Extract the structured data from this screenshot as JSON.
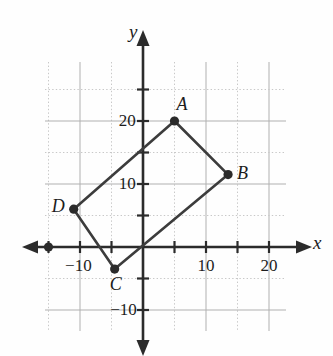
{
  "figure": {
    "kind": "coordinate-plane-quadrilateral",
    "background": "#fefefe",
    "ink": "#3c3c3c",
    "grid_major_color": "#b0b0b0",
    "grid_minor_color": "#c8c8c8",
    "axis_color": "#2b2b2b",
    "point_color": "#2b2b2b"
  },
  "axes": {
    "x_label": "x",
    "y_label": "y",
    "x_range": [
      -17,
      23
    ],
    "y_range": [
      -14,
      27
    ],
    "tick_step": 5,
    "grid_step_major": 10,
    "grid_step_minor": 5,
    "x_ticks": [
      {
        "value": -10,
        "label": "−10"
      },
      {
        "value": 10,
        "label": "10"
      },
      {
        "value": 20,
        "label": "20"
      }
    ],
    "y_ticks": [
      {
        "value": 10,
        "label": "10"
      },
      {
        "value": 20,
        "label": "20"
      },
      {
        "value": -10,
        "label": "−10"
      }
    ]
  },
  "chart_data": {
    "type": "scatter",
    "title": "",
    "xlabel": "x",
    "ylabel": "y",
    "xlim": [
      -17,
      23
    ],
    "ylim": [
      -14,
      27
    ],
    "grid": true,
    "vertices": [
      {
        "name": "A",
        "x": 5,
        "y": 20,
        "label_dx": 1,
        "label_dy": 5
      },
      {
        "name": "B",
        "x": 13.5,
        "y": 11.5,
        "label_dx": 5,
        "label_dy": 1
      },
      {
        "name": "C",
        "x": -4.5,
        "y": -3.5,
        "label_dx": 0,
        "label_dy": -5
      },
      {
        "name": "D",
        "x": -11,
        "y": 6,
        "label_dx": -6,
        "label_dy": 1
      }
    ],
    "polygon_closed": true,
    "extra_points": [
      {
        "name": "axis-marker",
        "x": -15,
        "y": 0
      }
    ]
  },
  "labels": {
    "A": "A",
    "B": "B",
    "C": "C",
    "D": "D",
    "x_axis": "x",
    "y_axis": "y"
  }
}
